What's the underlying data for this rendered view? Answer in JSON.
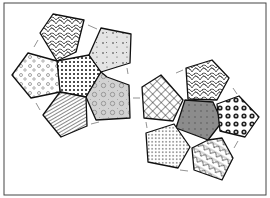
{
  "diagram": {
    "type": "dodecahedron-net",
    "border_color": "#333333",
    "background": "#ffffff",
    "groups": [
      {
        "name": "left-flower",
        "center": {
          "pattern": "dots",
          "fill": "#ffffff"
        },
        "petals": [
          {
            "position": "top",
            "pattern": "leaf-scribble"
          },
          {
            "position": "upper-right",
            "pattern": "light-gray-sprinkles"
          },
          {
            "position": "lower-right",
            "pattern": "gray-floral"
          },
          {
            "position": "bottom",
            "pattern": "stripes-patchwork"
          },
          {
            "position": "left",
            "pattern": "white-floral-clusters"
          }
        ]
      },
      {
        "name": "right-flower",
        "center": {
          "pattern": "gray-dots",
          "fill": "#8a8a8a"
        },
        "petals": [
          {
            "position": "top",
            "pattern": "leaf-scribble"
          },
          {
            "position": "right",
            "pattern": "dark-flowers"
          },
          {
            "position": "bottom",
            "pattern": "leaf-scribble-2"
          },
          {
            "position": "lower-left",
            "pattern": "small-dots"
          },
          {
            "position": "upper-left",
            "pattern": "grid"
          }
        ]
      }
    ],
    "join_arrow_color": "#777777"
  }
}
